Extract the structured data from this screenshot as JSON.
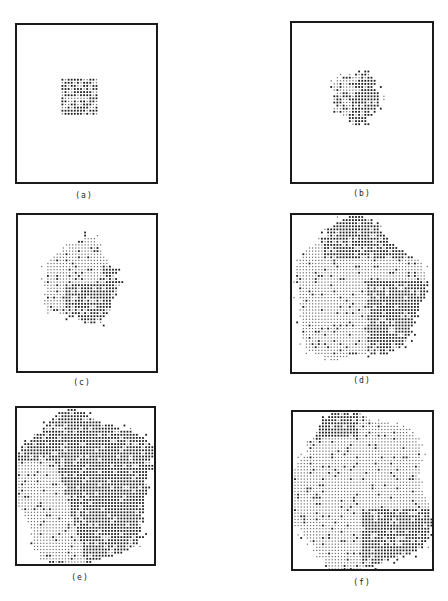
{
  "figure": {
    "panels": [
      {
        "id": "a",
        "label": "(a)",
        "frame": {
          "x": 15,
          "y": 23,
          "w": 143,
          "h": 161
        },
        "caption_pos": {
          "x": 64,
          "y": 191
        },
        "shape": "square",
        "cx": 33,
        "cy": 48,
        "r": 19,
        "split": "none"
      },
      {
        "id": "b",
        "label": "(b)",
        "frame": {
          "x": 290,
          "y": 21,
          "w": 144,
          "h": 163
        },
        "caption_pos": {
          "x": 342,
          "y": 189
        },
        "shape": "blob",
        "cx": 58,
        "cy": 69,
        "r": 26,
        "split": "b"
      },
      {
        "id": "c",
        "label": "(c)",
        "frame": {
          "x": 16,
          "y": 213,
          "w": 142,
          "h": 160
        },
        "caption_pos": {
          "x": 62,
          "y": 378
        },
        "shape": "blob",
        "cx": 48,
        "cy": 67,
        "r": 40,
        "split": "c"
      },
      {
        "id": "d",
        "label": "(d)",
        "frame": {
          "x": 290,
          "y": 213,
          "w": 144,
          "h": 161
        },
        "caption_pos": {
          "x": 342,
          "y": 376
        },
        "shape": "blob",
        "cx": 64,
        "cy": 80,
        "r": 68,
        "split": "d"
      },
      {
        "id": "e",
        "label": "(e)",
        "frame": {
          "x": 15,
          "y": 406,
          "w": 141,
          "h": 160
        },
        "caption_pos": {
          "x": 60,
          "y": 573
        },
        "shape": "blob",
        "cx": 62,
        "cy": 78,
        "r": 74,
        "split": "e"
      },
      {
        "id": "f",
        "label": "(f)",
        "frame": {
          "x": 291,
          "y": 410,
          "w": 143,
          "h": 161
        },
        "caption_pos": {
          "x": 342,
          "y": 578
        },
        "shape": "blob",
        "cx": 64,
        "cy": 80,
        "r": 76,
        "split": "f"
      }
    ],
    "colors": {
      "frame": "#1a1a1a",
      "dot_dark": "#1e1e1e",
      "dot_light": "#6a6a6a",
      "paper": "#ffffff"
    }
  }
}
